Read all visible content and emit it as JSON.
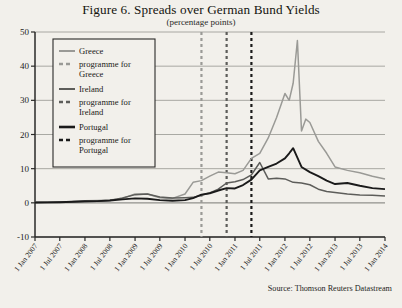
{
  "figure": {
    "title": "Figure 6. Spreads over German Bund Yields",
    "subtitle": "(percentage points)",
    "source": "Source: Thomson Reuters Datastream"
  },
  "colors": {
    "greece": "#9a9a96",
    "ireland": "#5d5d5a",
    "portugal": "#1a1a1a",
    "grid": "#8d8d88",
    "axis": "#2a2a28",
    "background": "#f2f0eb"
  },
  "legend": {
    "items": [
      {
        "label": "Greece",
        "style": "solid",
        "color_key": "greece"
      },
      {
        "label": "programme for Greece",
        "style": "dashed",
        "color_key": "greece"
      },
      {
        "label": "Ireland",
        "style": "solid",
        "color_key": "ireland"
      },
      {
        "label": "programme for Ireland",
        "style": "dashed",
        "color_key": "ireland"
      },
      {
        "label": "Portugal",
        "style": "solid",
        "color_key": "portugal"
      },
      {
        "label": "programme for Portugal",
        "style": "dashed",
        "color_key": "portugal"
      }
    ]
  },
  "chart_data": {
    "type": "line",
    "title": "Figure 6. Spreads over German Bund Yields",
    "subtitle": "(percentage points)",
    "xlabel": "",
    "ylabel": "percentage points",
    "ylim": [
      -10,
      50
    ],
    "yticks": [
      -10,
      0,
      10,
      20,
      30,
      40,
      50
    ],
    "ytick_labels": [
      "-10",
      "0",
      "10",
      "20",
      "30",
      "40",
      "50"
    ],
    "grid": true,
    "legend_position": "upper-left",
    "xlim": [
      "2007-01-01",
      "2014-01-01"
    ],
    "xticks": [
      "1 Jan 2007",
      "1 Jul 2007",
      "1 Jan 2008",
      "1 Jul 2008",
      "1 Jan 2009",
      "1 Jul 2009",
      "1 Jan 2010",
      "1 Jul 2010",
      "1 Jan 2011",
      "1 Jul 2011",
      "1 Jan 2012",
      "1 Jul 2012",
      "1 Jan 2013",
      "1 Jul 2013",
      "1 Jan 2014"
    ],
    "annotations": [
      {
        "label": "programme for Greece",
        "x": "2010-05-01",
        "type": "vline",
        "style": "dashed",
        "color_key": "greece"
      },
      {
        "label": "programme for Ireland",
        "x": "2010-11-01",
        "type": "vline",
        "style": "dashed",
        "color_key": "ireland"
      },
      {
        "label": "programme for Portugal",
        "x": "2011-05-01",
        "type": "vline",
        "style": "dashed",
        "color_key": "portugal"
      }
    ],
    "series": [
      {
        "name": "Greece",
        "color_key": "greece",
        "x": [
          "2007-01",
          "2007-04",
          "2007-07",
          "2007-10",
          "2008-01",
          "2008-04",
          "2008-07",
          "2008-10",
          "2009-01",
          "2009-04",
          "2009-07",
          "2009-10",
          "2010-01",
          "2010-03",
          "2010-05",
          "2010-07",
          "2010-09",
          "2010-11",
          "2011-01",
          "2011-03",
          "2011-05",
          "2011-07",
          "2011-09",
          "2011-11",
          "2012-01",
          "2012-02",
          "2012-03",
          "2012-04",
          "2012-05",
          "2012-06",
          "2012-07",
          "2012-09",
          "2012-11",
          "2013-01",
          "2013-04",
          "2013-07",
          "2013-10",
          "2014-01"
        ],
        "values": [
          0.2,
          0.25,
          0.3,
          0.4,
          0.6,
          0.7,
          0.8,
          1.3,
          2.6,
          2.6,
          1.5,
          1.3,
          2.6,
          6.0,
          6.5,
          7.8,
          9.0,
          8.8,
          8.5,
          9.5,
          13.0,
          14.5,
          19.0,
          25.0,
          32.0,
          30.0,
          35.0,
          47.5,
          21.0,
          24.5,
          23.5,
          18.0,
          14.5,
          10.5,
          9.5,
          8.8,
          7.8,
          7.0
        ]
      },
      {
        "name": "Ireland",
        "color_key": "ireland",
        "x": [
          "2007-01",
          "2007-04",
          "2007-07",
          "2007-10",
          "2008-01",
          "2008-04",
          "2008-07",
          "2008-10",
          "2009-01",
          "2009-04",
          "2009-07",
          "2009-10",
          "2010-01",
          "2010-03",
          "2010-05",
          "2010-07",
          "2010-09",
          "2010-11",
          "2011-01",
          "2011-03",
          "2011-05",
          "2011-07",
          "2011-09",
          "2011-11",
          "2012-01",
          "2012-03",
          "2012-05",
          "2012-07",
          "2012-09",
          "2012-11",
          "2013-01",
          "2013-04",
          "2013-07",
          "2013-10",
          "2014-01"
        ],
        "values": [
          0.1,
          0.12,
          0.15,
          0.25,
          0.4,
          0.5,
          0.7,
          1.4,
          2.4,
          2.6,
          1.7,
          1.4,
          1.5,
          1.6,
          2.2,
          2.9,
          4.0,
          5.8,
          6.2,
          6.8,
          8.2,
          11.8,
          7.0,
          7.2,
          7.0,
          6.0,
          5.8,
          5.3,
          4.0,
          3.3,
          3.0,
          2.6,
          2.3,
          2.2,
          2.0
        ]
      },
      {
        "name": "Portugal",
        "color_key": "portugal",
        "x": [
          "2007-01",
          "2007-04",
          "2007-07",
          "2007-10",
          "2008-01",
          "2008-04",
          "2008-07",
          "2008-10",
          "2009-01",
          "2009-04",
          "2009-07",
          "2009-10",
          "2010-01",
          "2010-03",
          "2010-05",
          "2010-07",
          "2010-09",
          "2010-11",
          "2011-01",
          "2011-03",
          "2011-05",
          "2011-07",
          "2011-09",
          "2011-11",
          "2012-01",
          "2012-02",
          "2012-03",
          "2012-05",
          "2012-07",
          "2012-09",
          "2012-11",
          "2013-01",
          "2013-04",
          "2013-07",
          "2013-10",
          "2014-01"
        ],
        "values": [
          0.1,
          0.12,
          0.18,
          0.3,
          0.45,
          0.5,
          0.7,
          1.0,
          1.3,
          1.2,
          0.8,
          0.6,
          0.8,
          1.4,
          2.4,
          2.8,
          3.6,
          4.3,
          4.2,
          5.2,
          6.8,
          9.5,
          10.5,
          11.5,
          13.0,
          14.5,
          16.0,
          10.5,
          9.0,
          7.8,
          6.5,
          5.5,
          5.8,
          5.0,
          4.3,
          4.0
        ]
      }
    ]
  }
}
